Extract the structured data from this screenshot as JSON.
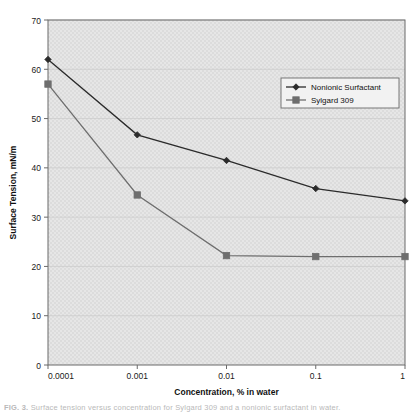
{
  "figure": {
    "caption_label": "FIG. 3.",
    "caption_text": "Surface tension versus concentration for Sylgard 309 and a nonionic surfactant in water."
  },
  "chart_data": {
    "type": "line",
    "title": "",
    "xlabel": "Concentration, % in water",
    "ylabel": "Surface Tension, mN/m",
    "xscale": "log",
    "xlim": [
      0.0001,
      1
    ],
    "ylim": [
      0,
      70
    ],
    "ytick_step": 10,
    "grid": true,
    "legend_position": "top-right",
    "x": [
      0.0001,
      0.001,
      0.01,
      0.1,
      1
    ],
    "xtick_labels": [
      "0.0001",
      "0.001",
      "0.01",
      "0.1",
      "1"
    ],
    "ytick_labels": [
      "0",
      "10",
      "20",
      "30",
      "40",
      "50",
      "60",
      "70"
    ],
    "series": [
      {
        "name": "Nonionic Surfactant",
        "marker": "diamond",
        "color": "#2b2b2b",
        "values": [
          62.0,
          46.7,
          41.5,
          35.8,
          33.3
        ]
      },
      {
        "name": "Sylgard 309",
        "marker": "square",
        "color": "#6e6e6e",
        "values": [
          57.0,
          34.5,
          22.2,
          22.0,
          22.0
        ]
      }
    ]
  }
}
